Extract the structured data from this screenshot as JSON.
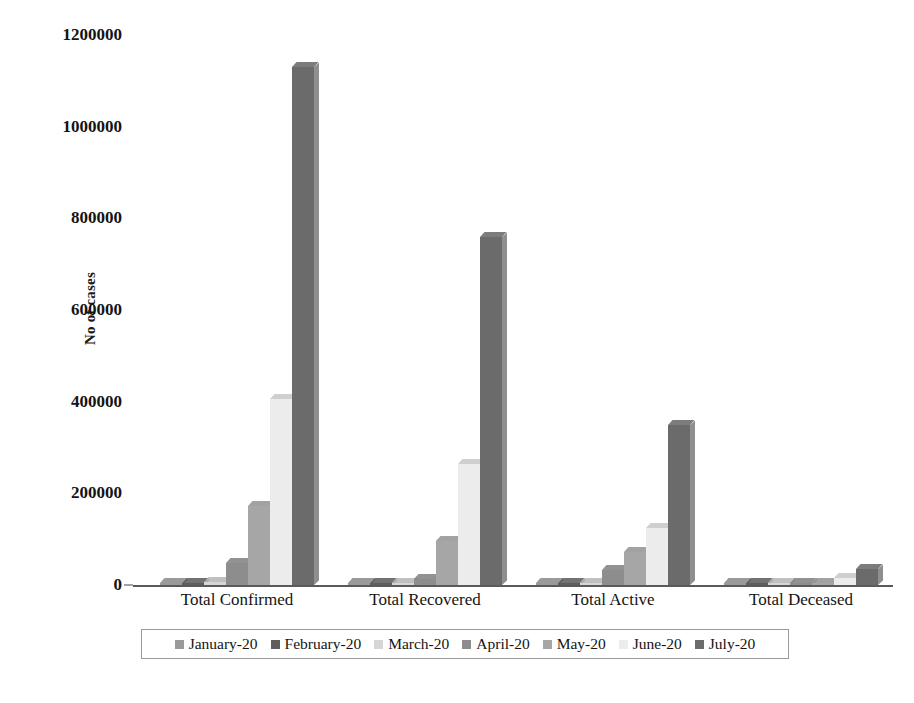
{
  "chart_data": {
    "type": "bar",
    "title": "",
    "subtitle": "",
    "xlabel": "",
    "ylabel": "No of cases",
    "ylim": [
      0,
      1200000
    ],
    "ytick_step": 200000,
    "yticks": [
      "0",
      "200000",
      "400000",
      "600000",
      "800000",
      "1000000",
      "1200000"
    ],
    "ytick_values": [
      0,
      200000,
      400000,
      600000,
      800000,
      1000000,
      1200000
    ],
    "grid": false,
    "legend_position": "bottom",
    "style": "3d-column",
    "categories": [
      "Total Confirmed",
      "Total Recovered",
      "Total Active",
      "Total Deceased"
    ],
    "series": [
      {
        "name": "January-20",
        "color": "#9a9a9a",
        "values": [
          1,
          0,
          1,
          0
        ]
      },
      {
        "name": "February-20",
        "color": "#5e5e5e",
        "values": [
          3,
          3,
          0,
          0
        ]
      },
      {
        "name": "March-20",
        "color": "#d6d6d6",
        "values": [
          6800,
          1300,
          5200,
          250
        ]
      },
      {
        "name": "April-20",
        "color": "#8d8d8d",
        "values": [
          48000,
          13000,
          32000,
          1700
        ]
      },
      {
        "name": "May-20",
        "color": "#a6a6a6",
        "values": [
          172000,
          95000,
          72000,
          5200
        ]
      },
      {
        "name": "June-20",
        "color": "#ececec",
        "values": [
          405000,
          265000,
          125000,
          16000
        ]
      },
      {
        "name": "July-20",
        "color": "#6b6b6b",
        "values": [
          1130000,
          760000,
          350000,
          34000
        ]
      }
    ]
  },
  "legend": {
    "items": [
      {
        "label": "January-20"
      },
      {
        "label": "February-20"
      },
      {
        "label": "March-20"
      },
      {
        "label": "April-20"
      },
      {
        "label": "May-20"
      },
      {
        "label": "June-20"
      },
      {
        "label": "July-20"
      }
    ]
  }
}
